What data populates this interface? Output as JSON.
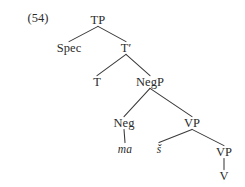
{
  "figure": {
    "example_number": "(54)",
    "type": "syntax-tree",
    "colors": {
      "background": "#ffffff",
      "text": "#2b2b2b",
      "branch": "#3a3a3a"
    },
    "nodes": [
      {
        "id": "tp",
        "label": "TP",
        "x": 98,
        "y": 20,
        "style": "category"
      },
      {
        "id": "spec",
        "label": "Spec",
        "x": 69,
        "y": 48,
        "style": "category"
      },
      {
        "id": "tbar",
        "label": "T′",
        "x": 126,
        "y": 48,
        "style": "category"
      },
      {
        "id": "t",
        "label": "T",
        "x": 97,
        "y": 82,
        "style": "category"
      },
      {
        "id": "negp",
        "label": "NegP",
        "x": 150,
        "y": 82,
        "style": "category"
      },
      {
        "id": "neg",
        "label": "Neg",
        "x": 124,
        "y": 123,
        "style": "category"
      },
      {
        "id": "vp1",
        "label": "VP",
        "x": 192,
        "y": 123,
        "style": "category"
      },
      {
        "id": "ma",
        "label": "ma",
        "x": 125,
        "y": 149,
        "style": "terminal"
      },
      {
        "id": "s",
        "label": "š",
        "x": 159,
        "y": 149,
        "style": "terminal"
      },
      {
        "id": "vp2",
        "label": "VP",
        "x": 224,
        "y": 152,
        "style": "category"
      },
      {
        "id": "v",
        "label": "V",
        "x": 224,
        "y": 176,
        "style": "category"
      }
    ],
    "edges": [
      {
        "from": "tp",
        "to": "spec"
      },
      {
        "from": "tp",
        "to": "tbar"
      },
      {
        "from": "tbar",
        "to": "t"
      },
      {
        "from": "tbar",
        "to": "negp"
      },
      {
        "from": "negp",
        "to": "neg"
      },
      {
        "from": "negp",
        "to": "vp1"
      },
      {
        "from": "neg",
        "to": "ma"
      },
      {
        "from": "vp1",
        "to": "s"
      },
      {
        "from": "vp1",
        "to": "vp2"
      },
      {
        "from": "vp2",
        "to": "v"
      }
    ]
  }
}
